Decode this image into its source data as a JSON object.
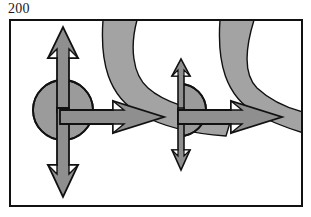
{
  "figure": {
    "label": "200",
    "kind": "technical-line-drawing",
    "background_color": "#ffffff",
    "frame": {
      "x": 9,
      "y": 19,
      "width": 294,
      "height": 188,
      "stroke_color": "#111111",
      "stroke_width": 2,
      "fill_color": "#ffffff"
    },
    "palette": {
      "body_fill": "#9b9b9b",
      "band_fill": "#a3a3a3",
      "overlap_fill": "#7e7e7e",
      "arrow_fill": "#8f8f8f",
      "outline": "#111111",
      "label_color": "#1a1a1a",
      "page_background": "#ffffff"
    },
    "elements": [
      {
        "name": "left-body-circle",
        "shape": "circle",
        "cx": 63,
        "cy": 110,
        "r": 30,
        "fill": "#9b9b9b"
      },
      {
        "name": "right-body-half-circle",
        "shape": "half-circle",
        "cx": 182,
        "cy": 110,
        "r": 26,
        "flat_side": "left",
        "fill": "#9b9b9b"
      },
      {
        "name": "left-curved-band",
        "shape": "curved-band",
        "top_x_start": 103,
        "top_x_end": 137,
        "fill": "#a3a3a3",
        "direction": "from-top-curving-right-and-down"
      },
      {
        "name": "right-curved-band",
        "shape": "curved-band",
        "top_x_start": 220,
        "top_x_end": 255,
        "fill": "#a3a3a3",
        "direction": "from-top-curving-right-and-down"
      },
      {
        "name": "left-up-arrow",
        "shape": "arrow",
        "direction": "up",
        "weight": "thick",
        "tail_x": 63,
        "tail_y": 110,
        "tip_y": 28
      },
      {
        "name": "left-down-arrow",
        "shape": "arrow",
        "direction": "down",
        "weight": "thick",
        "tail_x": 63,
        "tail_y": 110,
        "tip_y": 196
      },
      {
        "name": "left-right-arrow",
        "shape": "arrow",
        "direction": "right",
        "weight": "thick",
        "tail_x": 63,
        "tail_y": 117,
        "tip_x": 163
      },
      {
        "name": "right-up-arrow",
        "shape": "arrow",
        "direction": "up",
        "weight": "thin",
        "tail_x": 180,
        "tail_y": 110,
        "tip_y": 60
      },
      {
        "name": "right-down-arrow",
        "shape": "arrow",
        "direction": "down",
        "weight": "thin",
        "tail_x": 180,
        "tail_y": 110,
        "tip_y": 170
      },
      {
        "name": "right-right-arrow",
        "shape": "arrow",
        "direction": "right",
        "weight": "thick",
        "tail_x": 180,
        "tail_y": 117,
        "tip_x": 281
      }
    ]
  }
}
